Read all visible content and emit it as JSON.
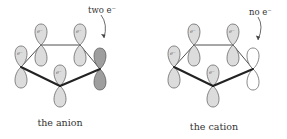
{
  "panels": [
    {
      "id": "anion",
      "caption": "the anion",
      "note": "two e⁻",
      "electron_label": "e⁻",
      "special_orbital": "filled-dark",
      "colors": {
        "lobe_fill": "#dcdcdc",
        "special_fill": "#9e9e9e",
        "outline": "#555555",
        "bond": "#222222"
      },
      "atoms_with_electron_labels": [
        "C1",
        "C2",
        "C3",
        "C5"
      ],
      "special_atom": "C4"
    },
    {
      "id": "cation",
      "caption": "the cation",
      "note": "no e⁻",
      "electron_label": "e⁻",
      "special_orbital": "empty",
      "colors": {
        "lobe_fill": "#dcdcdc",
        "special_fill": "#ffffff",
        "outline": "#555555",
        "bond": "#222222"
      },
      "atoms_with_electron_labels": [
        "C1",
        "C2",
        "C3",
        "C5"
      ],
      "special_atom": "C4"
    }
  ]
}
